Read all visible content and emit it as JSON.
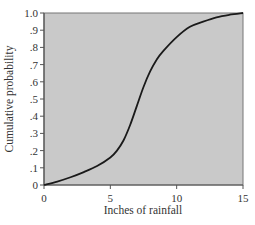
{
  "chart_data": {
    "type": "line",
    "title": "",
    "xlabel": "Inches of rainfall",
    "ylabel": "Cumulative probability",
    "xlim": [
      0,
      15
    ],
    "ylim": [
      0,
      1.0
    ],
    "x_ticks": [
      0,
      5,
      10,
      15
    ],
    "x_tick_labels": [
      "0",
      "5",
      "10",
      "15"
    ],
    "y_ticks": [
      0,
      0.1,
      0.2,
      0.3,
      0.4,
      0.5,
      0.6,
      0.7,
      0.8,
      0.9,
      1.0
    ],
    "y_tick_labels": [
      "0",
      ".1",
      ".2",
      ".3",
      ".4",
      ".5",
      ".6",
      ".7",
      ".8",
      ".9",
      "1.0"
    ],
    "grid": false,
    "legend": null,
    "series": [
      {
        "name": "Cumulative probability",
        "x": [
          0,
          1,
          2,
          3,
          4,
          5,
          5.5,
          6,
          6.5,
          7,
          7.5,
          8,
          8.5,
          9,
          10,
          11,
          12,
          13,
          14,
          15
        ],
        "values": [
          0,
          0.02,
          0.045,
          0.075,
          0.11,
          0.16,
          0.2,
          0.26,
          0.35,
          0.46,
          0.57,
          0.66,
          0.73,
          0.78,
          0.86,
          0.92,
          0.95,
          0.975,
          0.99,
          1.0
        ]
      }
    ]
  },
  "colors": {
    "plot_background": "#c9c9c9",
    "axis": "#555555",
    "line": "#1a1a1a"
  }
}
